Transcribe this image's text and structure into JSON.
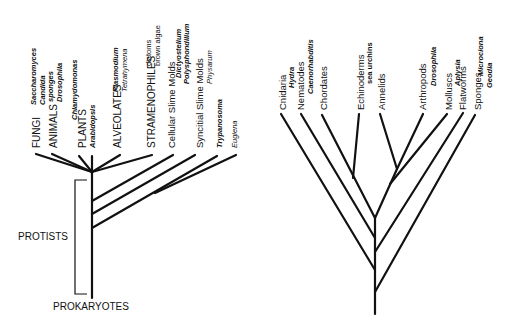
{
  "left_tree": {
    "root_label": "PROKARYOTES",
    "bracket_label": "PROTISTS",
    "groups": [
      {
        "name": "FUNGI",
        "examples": [
          "Saccharomyces",
          "Candida"
        ],
        "example_style": "bold-italic"
      },
      {
        "name": "ANIMALS",
        "examples": [
          "sponges",
          "Drosophila"
        ],
        "example_style": "bold-italic"
      },
      {
        "name": "PLANTS",
        "examples": [
          "Chlamydomonas",
          "Arabidopsis"
        ],
        "example_style": "bold-italic"
      },
      {
        "name": "ALVEOLATES",
        "examples": [
          "Plasmodium",
          "Tetrahymena"
        ],
        "example_style": "italic"
      },
      {
        "name": "STRAMENOPHILES",
        "examples": [
          "diatoms",
          "brown algae"
        ],
        "example_style": "plain"
      },
      {
        "name": "Cellular Slime Molds",
        "examples": [
          "Dictyostelium",
          "Polysphondilium"
        ],
        "example_style": "bold-italic"
      },
      {
        "name": "Syncitial Slime Molds",
        "examples": [
          "Physarum"
        ],
        "example_style": "italic"
      },
      {
        "name": "",
        "examples": [
          "Trypanosoma"
        ],
        "example_style": "bold-italic"
      },
      {
        "name": "",
        "examples": [
          "Euglena"
        ],
        "example_style": "italic"
      }
    ]
  },
  "right_tree": {
    "groups": [
      {
        "name": "Cnidaria",
        "example": "Hydra"
      },
      {
        "name": "Nematodes",
        "example": "Caenorhabditis"
      },
      {
        "name": "Chordates",
        "example": ""
      },
      {
        "name": "Echinoderms",
        "example": "sea urchins"
      },
      {
        "name": "Annelids",
        "example": ""
      },
      {
        "name": "Arthropods",
        "example": "Drosophila"
      },
      {
        "name": "Molluscs",
        "example": "Aplysia"
      },
      {
        "name": "Flatworms",
        "example": ""
      },
      {
        "name": "Sponges",
        "example": "Microciona Geodia"
      }
    ]
  },
  "labels": {
    "fungi": "FUNGI",
    "fungi_ex1": "Saccharomyces",
    "fungi_ex2": "Candida",
    "animals": "ANIMALS",
    "animals_ex1": "sponges",
    "animals_ex2": "Drosophila",
    "plants_ex1": "Chlamydomonas",
    "plants": "PLANTS",
    "plants_ex2": "Arabidopsis",
    "alveolates": "ALVEOLATES",
    "alveolates_ex1": "Plasmodium",
    "alveolates_ex2": "Tetrahymena",
    "stramenophiles": "STRAMENOPHILES",
    "stramenophiles_ex1": "diatoms",
    "stramenophiles_ex2": "brown algae",
    "cellular": "Cellular Slime Molds",
    "cellular_ex1": "Dictyostelium",
    "cellular_ex2": "Polysphondilium",
    "syncitial": "Syncitial Slime Molds",
    "syncitial_ex1": "Physarum",
    "trypanosoma": "Trypanosoma",
    "euglena": "Euglena",
    "protists": "PROTISTS",
    "prokaryotes": "PROKARYOTES",
    "cnidaria": "Cnidaria",
    "hydra": "Hydra",
    "nematodes": "Nematodes",
    "caenorhabditis": "Caenorhabditis",
    "chordates": "Chordates",
    "echinoderms": "Echinoderms",
    "sea_urchins": "sea urchins",
    "annelids": "Annelids",
    "arthropods": "Arthropods",
    "drosophila": "Drosophila",
    "molluscs": "Molluscs",
    "aplysia": "Aplysia",
    "flatworms": "Flatworms",
    "sponges": "Sponges",
    "microciona": "Microciona",
    "geodia": "Geodia"
  }
}
